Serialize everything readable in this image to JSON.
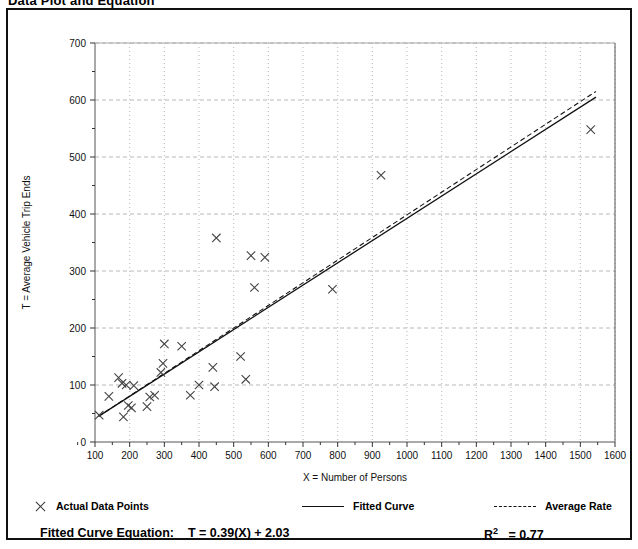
{
  "page": {
    "title": "Data Plot and Equation"
  },
  "chart_data": {
    "type": "scatter",
    "title": "",
    "xlabel": "X = Number of Persons",
    "ylabel": "T = Average Vehicle Trip Ends",
    "xlim": [
      100,
      1600
    ],
    "ylim": [
      0,
      700
    ],
    "xticks": [
      100,
      200,
      300,
      400,
      500,
      600,
      700,
      800,
      900,
      1000,
      1100,
      1200,
      1300,
      1400,
      1500,
      1600
    ],
    "yticks": [
      0,
      100,
      200,
      300,
      400,
      500,
      600,
      700
    ],
    "y_minor_tick_step": 50,
    "grid": true,
    "grid_color": "#b8b8b8",
    "marker": "x",
    "marker_color": "#444444",
    "points": [
      {
        "x": 112,
        "y": 47
      },
      {
        "x": 140,
        "y": 80
      },
      {
        "x": 168,
        "y": 113
      },
      {
        "x": 178,
        "y": 103
      },
      {
        "x": 182,
        "y": 44
      },
      {
        "x": 190,
        "y": 100
      },
      {
        "x": 196,
        "y": 64
      },
      {
        "x": 205,
        "y": 60
      },
      {
        "x": 212,
        "y": 99
      },
      {
        "x": 250,
        "y": 62
      },
      {
        "x": 258,
        "y": 79
      },
      {
        "x": 272,
        "y": 82
      },
      {
        "x": 290,
        "y": 122
      },
      {
        "x": 296,
        "y": 138
      },
      {
        "x": 300,
        "y": 172
      },
      {
        "x": 350,
        "y": 168
      },
      {
        "x": 375,
        "y": 82
      },
      {
        "x": 400,
        "y": 100
      },
      {
        "x": 440,
        "y": 131
      },
      {
        "x": 445,
        "y": 97
      },
      {
        "x": 450,
        "y": 358
      },
      {
        "x": 520,
        "y": 150
      },
      {
        "x": 535,
        "y": 110
      },
      {
        "x": 550,
        "y": 327
      },
      {
        "x": 560,
        "y": 271
      },
      {
        "x": 590,
        "y": 324
      },
      {
        "x": 785,
        "y": 268
      },
      {
        "x": 925,
        "y": 468
      },
      {
        "x": 1530,
        "y": 548
      }
    ],
    "series": [
      {
        "name": "Fitted Curve",
        "type": "line",
        "style": "solid",
        "color": "#111111",
        "equation_slope": 0.39,
        "equation_intercept": 2.03,
        "x_start": 110,
        "x_end": 1545,
        "y_start": 45,
        "y_end": 605
      },
      {
        "name": "Average Rate",
        "type": "line",
        "style": "dashed",
        "color": "#111111",
        "x_start": 110,
        "x_end": 1545,
        "y_start": 45,
        "y_end": 615
      }
    ]
  },
  "legend": {
    "points_label": "Actual Data Points",
    "fitted_label": "Fitted Curve",
    "average_label": "Average Rate"
  },
  "equation": {
    "label": "Fitted Curve Equation:",
    "formula": "T = 0.39(X) + 2.03",
    "r_squared_symbol": "R",
    "r_squared_exponent": "2",
    "r_squared_value": "= 0.77"
  }
}
